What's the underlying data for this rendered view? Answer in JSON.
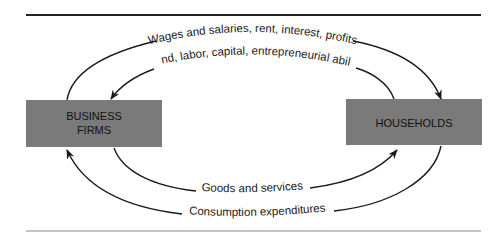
{
  "diagram": {
    "colors": {
      "box_fill": "#7a7a7a",
      "line": "#1a1a1a",
      "rule_top": "#222222",
      "rule_bottom": "#8a8a8a"
    },
    "nodes": {
      "business": {
        "line1": "BUSINESS",
        "line2": "FIRMS"
      },
      "households": {
        "label": "HOUSEHOLDS"
      }
    },
    "flows": {
      "wages": {
        "label": "Wages and salaries, rent, interest, profits",
        "from": "business",
        "to": "households"
      },
      "resources": {
        "label": "Land, labor, capital, entrepreneurial ability",
        "from": "households",
        "to": "business"
      },
      "goods": {
        "label": "Goods and services",
        "from": "business",
        "to": "households"
      },
      "expenditures": {
        "label": "Consumption expenditures",
        "from": "households",
        "to": "business"
      }
    }
  }
}
